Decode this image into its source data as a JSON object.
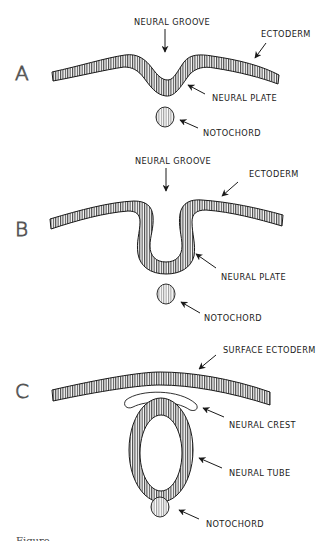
{
  "figure": {
    "type": "embryology-diagram",
    "colors": {
      "ink": "#1a1a1a",
      "panel_letter": "#555555",
      "background": "#ffffff"
    },
    "panels": [
      {
        "letter": "A",
        "labels": {
          "neural_groove": "NEURAL GROOVE",
          "ectoderm": "ECTODERM",
          "neural_plate": "NEURAL PLATE",
          "notochord": "NOTOCHORD"
        }
      },
      {
        "letter": "B",
        "labels": {
          "neural_groove": "NEURAL GROOVE",
          "ectoderm": "ECTODERM",
          "neural_plate": "NEURAL PLATE",
          "notochord": "NOTOCHORD"
        }
      },
      {
        "letter": "C",
        "labels": {
          "surface_ectoderm": "SURFACE ECTODERM",
          "neural_crest": "NEURAL CREST",
          "neural_tube": "NEURAL TUBE",
          "notochord": "NOTOCHORD"
        }
      }
    ],
    "caption_partial": "Figure …"
  }
}
